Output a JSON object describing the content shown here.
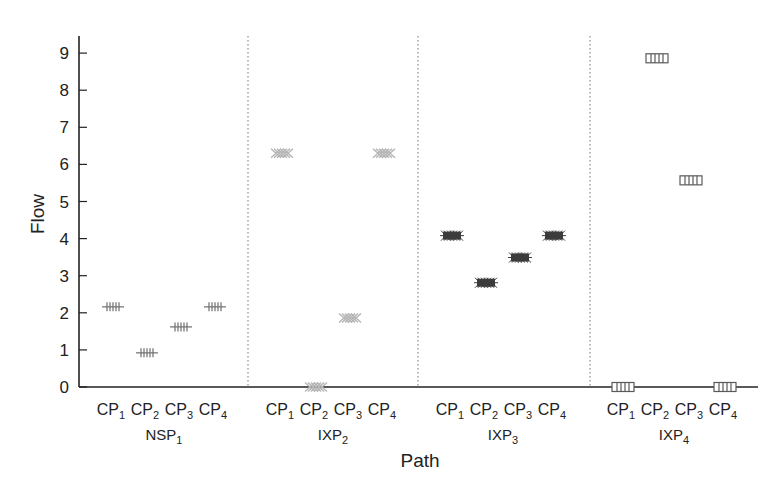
{
  "chart_data": {
    "type": "scatter",
    "title": "",
    "xlabel": "Path",
    "ylabel": "Flow",
    "ylim": [
      0,
      9.5
    ],
    "yticks": [
      0,
      1,
      2,
      3,
      4,
      5,
      6,
      7,
      8,
      9
    ],
    "grid": false,
    "legend": null,
    "groups": [
      {
        "name": "NSP",
        "sub": "1",
        "marker": "plus",
        "color": "#6e6e6e",
        "categories": [
          "CP1",
          "CP2",
          "CP3",
          "CP4"
        ],
        "values": [
          2.16,
          0.92,
          1.62,
          2.16
        ]
      },
      {
        "name": "IXP",
        "sub": "2",
        "marker": "cross",
        "color": "#b4b4b4",
        "categories": [
          "CP1",
          "CP2",
          "CP3",
          "CP4"
        ],
        "values": [
          6.3,
          0.0,
          1.86,
          6.3
        ]
      },
      {
        "name": "IXP",
        "sub": "3",
        "marker": "star",
        "color": "#3c3c3c",
        "categories": [
          "CP1",
          "CP2",
          "CP3",
          "CP4"
        ],
        "values": [
          4.08,
          2.81,
          3.49,
          4.08
        ]
      },
      {
        "name": "IXP",
        "sub": "4",
        "marker": "square",
        "color": "#5a5a5a",
        "categories": [
          "CP1",
          "CP2",
          "CP3",
          "CP4"
        ],
        "values": [
          0.0,
          8.86,
          5.57,
          0.0
        ]
      }
    ]
  }
}
